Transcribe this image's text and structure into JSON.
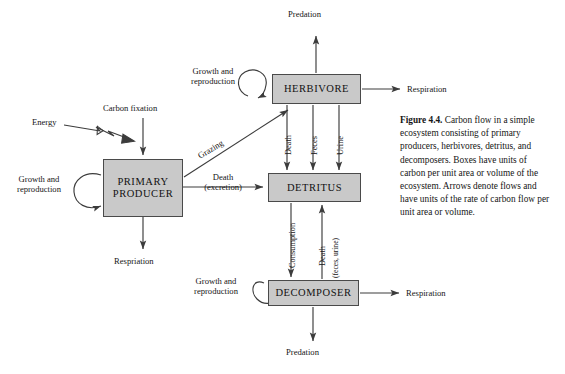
{
  "figure": {
    "label": "Figure 4.4.",
    "caption_text": " Carbon flow in a simple ecosystem consisting of primary producers, herbivores, detritus, and decomposers. Boxes have units of carbon per unit area or volume of the ecosystem. Arrows denote flows and have units of the rate of carbon flow per unit area or volume."
  },
  "diagram": {
    "type": "flow-diagram",
    "title": "Carbon flow in a simple ecosystem",
    "box_fill_color": "#c9c9c9",
    "box_border_color": "#4a4a4a",
    "arrow_color": "#3c3c3c",
    "nodes": [
      {
        "id": "primary-producer",
        "label": "PRIMARY\nPRODUCER",
        "line1": "PRIMARY",
        "line2": "PRODUCER",
        "x": 103,
        "y": 159,
        "w": 80,
        "h": 58
      },
      {
        "id": "herbivore",
        "label": "HERBIVORE",
        "x": 272,
        "y": 74,
        "w": 89,
        "h": 30
      },
      {
        "id": "detritus",
        "label": "DETRITUS",
        "x": 268,
        "y": 173,
        "w": 93,
        "h": 29
      },
      {
        "id": "decomposer",
        "label": "DECOMPOSER",
        "x": 268,
        "y": 280,
        "w": 91,
        "h": 26
      }
    ],
    "flows": [
      {
        "id": "energy",
        "label": "Energy",
        "style": "zigzag-hollow",
        "from": "external",
        "to": "carbon-fixation-arrow"
      },
      {
        "id": "carbon-fixation",
        "label": "Carbon fixation",
        "style": "down",
        "to": "primary-producer"
      },
      {
        "id": "grazing",
        "label": "Grazing",
        "style": "diagonal-up",
        "from": "primary-producer",
        "to": "herbivore"
      },
      {
        "id": "pp-death",
        "label_line1": "Death",
        "label_line2": "(excretion)",
        "style": "right",
        "from": "primary-producer",
        "to": "detritus"
      },
      {
        "id": "pp-respiration",
        "label": "Respriation",
        "style": "down",
        "from": "primary-producer"
      },
      {
        "id": "pp-growth",
        "label_line1": "Growth and",
        "label_line2": "reproduction",
        "style": "loop",
        "to": "primary-producer"
      },
      {
        "id": "herb-growth",
        "label_line1": "Growth and",
        "label_line2": "reproduction",
        "style": "loop",
        "to": "herbivore"
      },
      {
        "id": "herb-predation",
        "label": "Predation",
        "style": "up",
        "from": "herbivore"
      },
      {
        "id": "herb-respiration",
        "label": "Respiration",
        "style": "right",
        "from": "herbivore"
      },
      {
        "id": "herb-death",
        "label": "Death",
        "style": "down",
        "from": "herbivore",
        "to": "detritus"
      },
      {
        "id": "herb-feces",
        "label": "Feces",
        "style": "down",
        "from": "herbivore",
        "to": "detritus"
      },
      {
        "id": "herb-urine",
        "label": "Urine",
        "style": "down",
        "from": "herbivore",
        "to": "detritus"
      },
      {
        "id": "consumption",
        "label": "Consumption",
        "style": "down",
        "from": "detritus",
        "to": "decomposer"
      },
      {
        "id": "decomp-death",
        "label": "Death",
        "label_paren": "(feces, urine)",
        "style": "up",
        "from": "decomposer",
        "to": "detritus"
      },
      {
        "id": "decomp-growth",
        "label_line1": "Growth and",
        "label_line2": "reproduction",
        "style": "loop",
        "to": "decomposer"
      },
      {
        "id": "decomp-respiration",
        "label": "Respiration",
        "style": "right",
        "from": "decomposer"
      },
      {
        "id": "decomp-predation",
        "label": "Predation",
        "style": "down",
        "from": "decomposer"
      }
    ]
  }
}
